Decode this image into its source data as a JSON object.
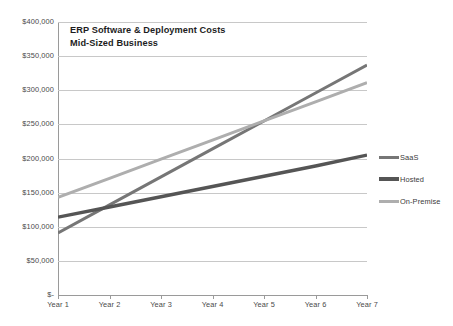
{
  "chart_data": {
    "type": "line",
    "title": "ERP Software & Deployment Costs",
    "subtitle": "Mid-Sized Business",
    "xlabel": "",
    "ylabel": "",
    "categories": [
      "Year 1",
      "Year 2",
      "Year 3",
      "Year 4",
      "Year 5",
      "Year 6",
      "Year 7"
    ],
    "ylim": [
      0,
      400000
    ],
    "ytick_values": [
      400000,
      350000,
      300000,
      250000,
      200000,
      150000,
      100000,
      50000,
      0
    ],
    "ytick_labels": [
      "$400,000",
      "$350,000",
      "$300,000",
      "$250,000",
      "$200,000",
      "$150,000",
      "$100,000",
      "$50,000",
      "$-"
    ],
    "grid": true,
    "legend_position": "right",
    "series": [
      {
        "name": "SaaS",
        "color": "#767676",
        "width": 3.0,
        "values": [
          91000,
          132000,
          173000,
          214000,
          255000,
          296000,
          337000
        ]
      },
      {
        "name": "Hosted",
        "color": "#555555",
        "width": 3.4,
        "values": [
          114000,
          129000,
          144000,
          159000,
          174000,
          189000,
          205000
        ]
      },
      {
        "name": "On-Premise",
        "color": "#aeaeae",
        "width": 3.0,
        "values": [
          143000,
          171000,
          199000,
          227000,
          255000,
          283000,
          311000
        ]
      }
    ]
  },
  "axis": {
    "grid_color": "#c8c8c8",
    "axis_color": "#9a9a9a"
  }
}
